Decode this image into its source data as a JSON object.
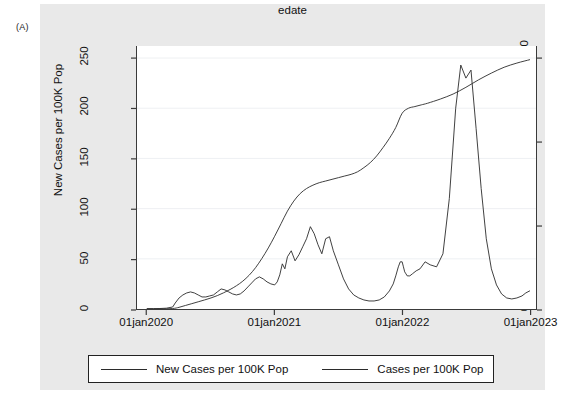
{
  "figure": {
    "panel_label": "(A)",
    "background_color": "#e9e9e9",
    "plot_background_color": "#ffffff",
    "line_color": "#2b2b2b"
  },
  "legend": {
    "entries": [
      {
        "label": "New Cases per 100K Pop",
        "color": "#2b2b2b"
      },
      {
        "label": "Cases per 100K Pop",
        "color": "#2b2b2b"
      }
    ]
  },
  "chart_data": {
    "type": "line",
    "title": "",
    "subtitle": "",
    "panel_label": "(A)",
    "xlabel": "edate",
    "ylabel": "New Cases per 100K Pop",
    "y2label": "Cases per 100K Pop",
    "xticklabels": [
      "01jan2020",
      "01jan2021",
      "01jan2022",
      "01jan2023"
    ],
    "xtickvalues": [
      2020.0,
      2021.0,
      2022.0,
      2023.0
    ],
    "xlim": [
      2019.92,
      2023.05
    ],
    "yticklabels": [
      "0",
      "50",
      "100",
      "150",
      "200",
      "250"
    ],
    "ytickvalues": [
      0,
      50,
      100,
      150,
      200,
      250
    ],
    "ylim": [
      0,
      262
    ],
    "y2ticklabels": [
      "0",
      "10000",
      "20000",
      "30000"
    ],
    "y2tickvalues": [
      0,
      10000,
      20000,
      30000
    ],
    "y2lim": [
      0,
      31440
    ],
    "grid": "horizontal",
    "legend_position": "below",
    "series": [
      {
        "name": "New Cases per 100K Pop",
        "axis": "left",
        "x": [
          2020.0,
          2020.05,
          2020.1,
          2020.15,
          2020.2,
          2020.22,
          2020.25,
          2020.28,
          2020.31,
          2020.34,
          2020.37,
          2020.4,
          2020.43,
          2020.46,
          2020.49,
          2020.52,
          2020.55,
          2020.58,
          2020.61,
          2020.64,
          2020.67,
          2020.7,
          2020.73,
          2020.76,
          2020.79,
          2020.82,
          2020.85,
          2020.88,
          2020.91,
          2020.94,
          2020.97,
          2021.0,
          2021.02,
          2021.04,
          2021.06,
          2021.08,
          2021.1,
          2021.13,
          2021.16,
          2021.19,
          2021.22,
          2021.25,
          2021.28,
          2021.31,
          2021.34,
          2021.37,
          2021.4,
          2021.43,
          2021.46,
          2021.5,
          2021.54,
          2021.58,
          2021.62,
          2021.66,
          2021.7,
          2021.74,
          2021.78,
          2021.82,
          2021.86,
          2021.9,
          2021.93,
          2021.95,
          2021.97,
          2021.985,
          2022.0,
          2022.01,
          2022.02,
          2022.03,
          2022.04,
          2022.06,
          2022.08,
          2022.11,
          2022.14,
          2022.18,
          2022.22,
          2022.27,
          2022.32,
          2022.37,
          2022.42,
          2022.46,
          2022.5,
          2022.54,
          2022.58,
          2022.62,
          2022.66,
          2022.7,
          2022.74,
          2022.78,
          2022.82,
          2022.86,
          2022.9,
          2022.94,
          2022.97,
          2023.0
        ],
        "y": [
          0.4,
          0.4,
          0.5,
          0.8,
          2,
          6,
          11,
          14,
          16,
          17,
          16,
          14,
          12,
          12,
          13,
          14,
          17,
          20,
          19,
          17,
          15,
          14,
          15,
          18,
          22,
          26,
          30,
          32,
          30,
          27,
          25,
          24,
          27,
          34,
          45,
          40,
          52,
          58,
          48,
          54,
          62,
          70,
          82,
          75,
          64,
          55,
          70,
          72,
          58,
          44,
          30,
          20,
          14,
          11,
          9,
          8,
          8,
          9,
          12,
          18,
          25,
          33,
          42,
          47,
          47,
          42,
          37,
          35,
          33,
          33,
          35,
          38,
          40,
          47,
          44,
          42,
          55,
          110,
          200,
          243,
          230,
          238,
          180,
          120,
          70,
          40,
          24,
          15,
          11,
          10,
          11,
          13,
          16,
          18
        ]
      },
      {
        "name": "Cases per 100K Pop",
        "axis": "right",
        "x": [
          2020.0,
          2020.1,
          2020.2,
          2020.25,
          2020.3,
          2020.35,
          2020.4,
          2020.45,
          2020.5,
          2020.55,
          2020.6,
          2020.65,
          2020.7,
          2020.75,
          2020.8,
          2020.85,
          2020.9,
          2020.95,
          2021.0,
          2021.05,
          2021.1,
          2021.15,
          2021.2,
          2021.25,
          2021.3,
          2021.35,
          2021.4,
          2021.45,
          2021.5,
          2021.55,
          2021.6,
          2021.65,
          2021.7,
          2021.75,
          2021.8,
          2021.85,
          2021.9,
          2021.95,
          2022.0,
          2022.05,
          2022.1,
          2022.15,
          2022.2,
          2022.3,
          2022.4,
          2022.5,
          2022.6,
          2022.7,
          2022.8,
          2022.9,
          2023.0
        ],
        "y": [
          0,
          10,
          60,
          200,
          420,
          640,
          860,
          1080,
          1320,
          1600,
          1940,
          2330,
          2780,
          3330,
          4040,
          4940,
          6050,
          7300,
          8700,
          10200,
          11700,
          12900,
          13800,
          14400,
          14800,
          15100,
          15300,
          15500,
          15700,
          15900,
          16100,
          16400,
          16900,
          17500,
          18300,
          19300,
          20400,
          21700,
          23400,
          24000,
          24200,
          24400,
          24600,
          25100,
          25700,
          26500,
          27400,
          28200,
          28900,
          29400,
          29800
        ]
      }
    ],
    "annotations": [
      {
        "text": "New cases peak",
        "x": 2022.0,
        "y": 243
      },
      {
        "text": "Cumulative at end",
        "x": 2023.0,
        "y2": 29800
      }
    ]
  }
}
